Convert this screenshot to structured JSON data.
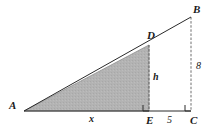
{
  "figure": {
    "kind": "geometry-diagram",
    "colors": {
      "stroke": "#2a2a2a",
      "shaded_fill": "#b3b3b3",
      "shaded_stroke": "#8c8c8c",
      "background": "#ffffff"
    },
    "points": {
      "A": {
        "label": "A",
        "x": 24,
        "y": 111
      },
      "B": {
        "label": "B",
        "x": 191,
        "y": 17
      },
      "C": {
        "label": "C",
        "x": 191,
        "y": 111
      },
      "D": {
        "label": "D",
        "x": 149,
        "y": 45
      },
      "E": {
        "label": "E",
        "x": 149,
        "y": 111
      }
    },
    "point_labels": [
      {
        "name": "label-A",
        "text": "A",
        "x": 9,
        "y": 100
      },
      {
        "name": "label-B",
        "text": "B",
        "x": 193,
        "y": 4
      },
      {
        "name": "label-C",
        "text": "C",
        "x": 190,
        "y": 115
      },
      {
        "name": "label-D",
        "text": "D",
        "x": 147,
        "y": 30
      },
      {
        "name": "label-E",
        "text": "E",
        "x": 146,
        "y": 115
      }
    ],
    "measure_labels": [
      {
        "name": "label-x",
        "text": "x",
        "x": 89,
        "y": 114
      },
      {
        "name": "label-5",
        "text": "5",
        "x": 167,
        "y": 115
      },
      {
        "name": "label-h",
        "text": "h",
        "x": 153,
        "y": 72
      },
      {
        "name": "label-8",
        "text": "8",
        "x": 196,
        "y": 61
      }
    ],
    "segments": [
      {
        "name": "segment-AC",
        "from": "A",
        "to": "C",
        "style": "solid"
      },
      {
        "name": "segment-AB",
        "from": "A",
        "to": "B",
        "style": "solid"
      },
      {
        "name": "segment-BC",
        "from": "B",
        "to": "C",
        "style": "dashed"
      },
      {
        "name": "segment-DE",
        "from": "D",
        "to": "E",
        "style": "dashed"
      }
    ],
    "shaded_region": {
      "name": "shaded-triangle-ADE",
      "vertices": [
        "A",
        "D",
        "E"
      ]
    },
    "right_angle_marks": [
      {
        "name": "right-angle-mark-E",
        "x": 143,
        "y": 105,
        "size": 6
      },
      {
        "name": "right-angle-mark-C",
        "x": 185,
        "y": 105,
        "size": 6
      }
    ]
  }
}
